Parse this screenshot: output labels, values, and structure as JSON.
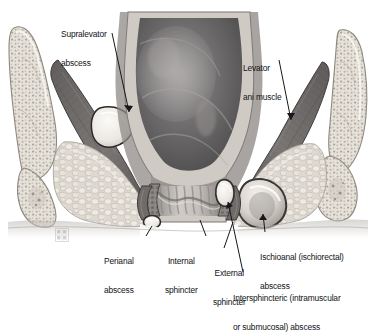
{
  "figure": {
    "type": "medical-illustration",
    "style": "grayscale-airbrush",
    "background_color": "#ffffff",
    "text_color": "#111316",
    "width": 377,
    "height": 311
  },
  "labels": {
    "supralevator": {
      "line1": "Supralevator",
      "line2": "abscess"
    },
    "levator": {
      "line1": "Levator",
      "line2": "ani muscle"
    },
    "perianal": {
      "line1": "Perianal",
      "line2": "abscess"
    },
    "internal_sphincter": {
      "line1": "Internal",
      "line2": "sphincter"
    },
    "external_sphincter": {
      "line1": "External",
      "line2": "sphincter"
    },
    "ischioanal": {
      "line1": "Ischioanal (ischiorectal)",
      "line2": "abscess"
    },
    "intersphincteric": {
      "line1": "Intersphincteric (intramuscular",
      "line2": "or submucosal) abscess"
    }
  },
  "structures": {
    "rectum": "rectum-lumen",
    "anal_canal": "anal-canal-with-columns",
    "levator_ani": "levator-ani-muscle",
    "internal_sphincter": "internal-anal-sphincter",
    "external_sphincter": "external-anal-sphincter",
    "ischioanal_fossa": "ischioanal-fossa-fat",
    "pelvic_bone_left": "left-ischium-bone",
    "pelvic_bone_right": "right-ischium-bone",
    "perineal_skin": "perineal-skin-line"
  },
  "abscesses": [
    {
      "name": "supralevator-abscess",
      "location": "above levator ani, left side"
    },
    {
      "name": "perianal-abscess",
      "location": "anal verge, left side"
    },
    {
      "name": "intersphincteric-abscess",
      "location": "between internal and external sphincters"
    },
    {
      "name": "ischioanal-abscess",
      "location": "ischioanal fossa, right side"
    }
  ],
  "watermark": {
    "name": "grid-watermark-icon"
  }
}
